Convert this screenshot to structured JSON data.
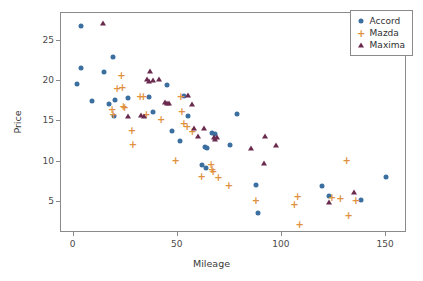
{
  "chart_data": {
    "type": "scatter",
    "title": "",
    "xlabel": "Mileage",
    "ylabel": "Price",
    "xlim": [
      -6,
      160
    ],
    "ylim": [
      1.2,
      28.4
    ],
    "xticks": [
      0,
      50,
      100,
      150
    ],
    "yticks": [
      5,
      10,
      15,
      20,
      25
    ],
    "grid": false,
    "legend_position": "upper right",
    "colors": {
      "accord": "#3b6fa0",
      "mazda": "#e0913f",
      "maxima": "#6a2a4e",
      "axis": "#8a8a8a",
      "text": "#3a3a3a",
      "background": "#ffffff"
    },
    "series": [
      {
        "name": "Accord",
        "marker": "circle",
        "color": "#3b6fa0",
        "points": [
          [
            4.2,
            26.7
          ],
          [
            4.0,
            21.5
          ],
          [
            2.3,
            19.5
          ],
          [
            9.5,
            17.4
          ],
          [
            15.0,
            21.0
          ],
          [
            19.5,
            22.8
          ],
          [
            17.6,
            17.0
          ],
          [
            20.5,
            17.5
          ],
          [
            20.0,
            15.6
          ],
          [
            26.8,
            17.8
          ],
          [
            36.5,
            17.9
          ],
          [
            38.5,
            16.0
          ],
          [
            45.5,
            19.4
          ],
          [
            47.5,
            13.7
          ],
          [
            51.5,
            12.5
          ],
          [
            53.5,
            18.0
          ],
          [
            55.5,
            15.6
          ],
          [
            62.0,
            9.5
          ],
          [
            63.5,
            11.7
          ],
          [
            64.5,
            11.6
          ],
          [
            64.0,
            9.1
          ],
          [
            67.0,
            13.4
          ],
          [
            68.5,
            13.3
          ],
          [
            75.5,
            12.0
          ],
          [
            79.0,
            15.8
          ],
          [
            88.0,
            7.0
          ],
          [
            89.0,
            3.6
          ],
          [
            119.5,
            6.9
          ],
          [
            123.0,
            5.6
          ],
          [
            138.5,
            5.1
          ],
          [
            150.5,
            8.0
          ]
        ]
      },
      {
        "name": "Mazda",
        "marker": "plus",
        "color": "#e0913f",
        "points": [
          [
            19.0,
            16.3
          ],
          [
            19.5,
            15.7
          ],
          [
            21.5,
            18.9
          ],
          [
            23.5,
            20.5
          ],
          [
            24.0,
            19.1
          ],
          [
            24.5,
            16.7
          ],
          [
            25.0,
            16.6
          ],
          [
            28.5,
            13.7
          ],
          [
            29.0,
            12.0
          ],
          [
            32.5,
            18.0
          ],
          [
            34.0,
            17.9
          ],
          [
            35.5,
            15.7
          ],
          [
            42.5,
            15.1
          ],
          [
            49.5,
            10.0
          ],
          [
            52.0,
            18.0
          ],
          [
            52.5,
            16.1
          ],
          [
            53.5,
            14.6
          ],
          [
            55.0,
            14.2
          ],
          [
            57.5,
            13.6
          ],
          [
            62.0,
            8.1
          ],
          [
            66.5,
            9.5
          ],
          [
            67.0,
            8.9
          ],
          [
            67.5,
            8.7
          ],
          [
            70.0,
            7.9
          ],
          [
            75.0,
            6.9
          ],
          [
            88.0,
            5.1
          ],
          [
            106.5,
            4.6
          ],
          [
            108.0,
            5.6
          ],
          [
            109.0,
            2.1
          ],
          [
            124.5,
            5.5
          ],
          [
            128.5,
            5.3
          ],
          [
            131.5,
            10.0
          ],
          [
            132.5,
            3.2
          ],
          [
            136.0,
            5.1
          ]
        ]
      },
      {
        "name": "Maxima",
        "marker": "triangle",
        "color": "#6a2a4e",
        "points": [
          [
            14.5,
            27.0
          ],
          [
            26.5,
            15.5
          ],
          [
            33.0,
            15.7
          ],
          [
            34.5,
            15.6
          ],
          [
            35.5,
            20.1
          ],
          [
            36.5,
            19.9
          ],
          [
            37.0,
            21.1
          ],
          [
            38.5,
            20.0
          ],
          [
            41.5,
            20.1
          ],
          [
            44.5,
            17.3
          ],
          [
            45.5,
            17.1
          ],
          [
            46.5,
            17.2
          ],
          [
            55.5,
            18.2
          ],
          [
            57.5,
            17.0
          ],
          [
            58.5,
            14.0
          ],
          [
            60.0,
            13.1
          ],
          [
            63.0,
            14.0
          ],
          [
            68.0,
            13.0
          ],
          [
            68.5,
            12.7
          ],
          [
            69.5,
            13.0
          ],
          [
            85.5,
            11.6
          ],
          [
            92.5,
            13.1
          ],
          [
            92.0,
            9.7
          ],
          [
            97.5,
            11.9
          ],
          [
            123.0,
            4.9
          ],
          [
            135.0,
            6.1
          ]
        ]
      }
    ]
  },
  "legend": {
    "items": [
      {
        "label": "Accord",
        "marker": "circle"
      },
      {
        "label": "Mazda",
        "marker": "plus"
      },
      {
        "label": "Maxima",
        "marker": "triangle"
      }
    ]
  },
  "axes": {
    "x_title": "Mileage",
    "y_title": "Price",
    "x_tick_labels": [
      "0",
      "50",
      "100",
      "150"
    ],
    "y_tick_labels": [
      "5",
      "10",
      "15",
      "20",
      "25"
    ]
  }
}
